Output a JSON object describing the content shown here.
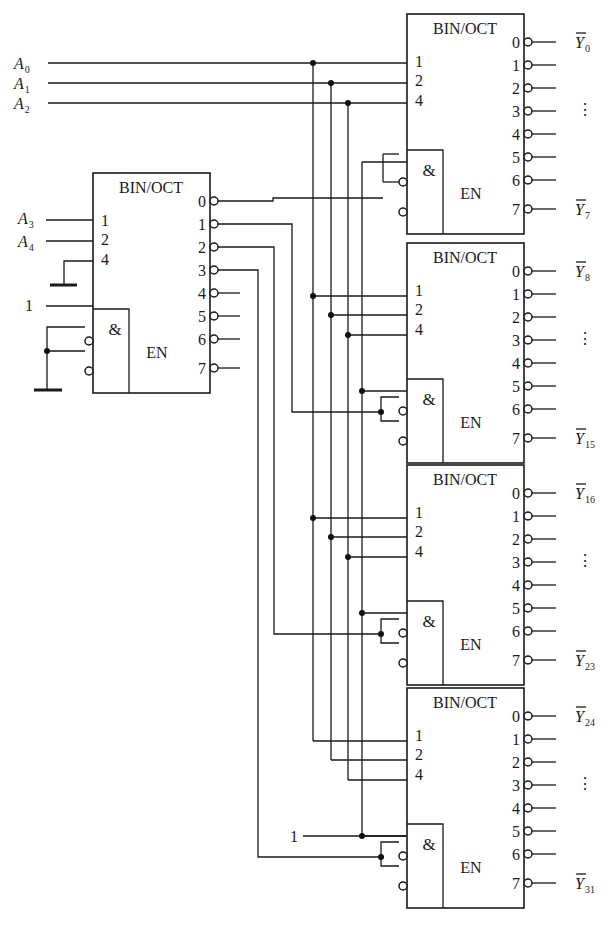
{
  "diagram": {
    "caption": "",
    "decoder_label": "BIN/OCT",
    "and_label": "&",
    "enable_label": "EN",
    "input_weights": [
      "1",
      "2",
      "4"
    ],
    "output_pins": [
      "0",
      "1",
      "2",
      "3",
      "4",
      "5",
      "6",
      "7"
    ],
    "ellipsis": "⋮",
    "inputs": [
      {
        "name": "A",
        "sub": "0"
      },
      {
        "name": "A",
        "sub": "1"
      },
      {
        "name": "A",
        "sub": "2"
      },
      {
        "name": "A",
        "sub": "3"
      },
      {
        "name": "A",
        "sub": "4"
      }
    ],
    "constant_high": "1",
    "first_stage": {
      "id": "decoder-select",
      "inputs": [
        "A3",
        "A4",
        "GND"
      ],
      "enable_inputs": [
        "1",
        "GND (active-low)",
        "GND (active-low)"
      ],
      "used_outputs": [
        "0",
        "1",
        "2",
        "3"
      ],
      "unused_outputs": [
        "4",
        "5",
        "6",
        "7"
      ]
    },
    "second_stage": [
      {
        "id": "decoder-0",
        "select_from": "0",
        "out_first": {
          "name": "Y",
          "sub": "0"
        },
        "out_last": {
          "name": "Y",
          "sub": "7"
        }
      },
      {
        "id": "decoder-1",
        "select_from": "1",
        "out_first": {
          "name": "Y",
          "sub": "8"
        },
        "out_last": {
          "name": "Y",
          "sub": "15"
        }
      },
      {
        "id": "decoder-2",
        "select_from": "2",
        "out_first": {
          "name": "Y",
          "sub": "16"
        },
        "out_last": {
          "name": "Y",
          "sub": "23"
        }
      },
      {
        "id": "decoder-3",
        "select_from": "3",
        "out_first": {
          "name": "Y",
          "sub": "24"
        },
        "out_last": {
          "name": "Y",
          "sub": "31"
        }
      }
    ]
  }
}
